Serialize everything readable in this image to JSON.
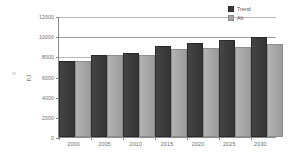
{
  "chart_data": {
    "type": "bar",
    "title": "",
    "xlabel": "",
    "ylabel": "PJ",
    "ylim": [
      0,
      12000
    ],
    "ytick_interval": 2000,
    "yticks": [
      "12000",
      "10000",
      "8000",
      "6000",
      "4000",
      "2000",
      "0"
    ],
    "ytick_values": [
      12000,
      10000,
      8000,
      6000,
      4000,
      2000,
      0
    ],
    "categories": [
      "2000",
      "2005",
      "2010",
      "2015",
      "2020",
      "2025",
      "2030"
    ],
    "grid": true,
    "legend_position": "top-right",
    "series": [
      {
        "name": "Trend",
        "color": "#3b3b3b",
        "values": [
          7300,
          7950,
          8150,
          8800,
          9150,
          9400,
          9750
        ]
      },
      {
        "name": "Alt",
        "color": "#a6a6a6",
        "values": [
          7350,
          7950,
          7950,
          8500,
          8650,
          8750,
          9050
        ]
      }
    ]
  },
  "legend": {
    "items": [
      {
        "label": "Trend"
      },
      {
        "label": "Alt"
      }
    ]
  },
  "axes": {
    "y_title": "PJ"
  },
  "colors": {
    "trend": "#3b3b3b",
    "alt": "#a6a6a6",
    "grid": "#b9b9b9",
    "axis": "#8a8a8a",
    "text": "#6d6d6d",
    "background": "#ffffff"
  }
}
